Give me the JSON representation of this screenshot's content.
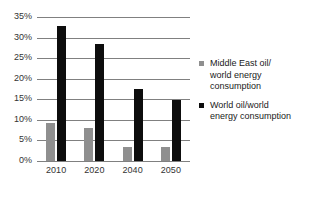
{
  "chart_data": {
    "type": "bar",
    "title": "",
    "subtitle": "",
    "xlabel": "",
    "ylabel": "",
    "categories": [
      "2010",
      "2020",
      "2040",
      "2050"
    ],
    "series": [
      {
        "name": "Middle East oil/world energy consumption",
        "color": "#8f8f8f",
        "values": [
          9.2,
          8.0,
          3.4,
          3.4
        ]
      },
      {
        "name": "World oil/world energy consumption",
        "color": "#0d0d0d",
        "values": [
          32.8,
          28.5,
          17.5,
          14.9
        ]
      }
    ],
    "ylim": [
      0,
      35
    ],
    "ytick_step": 5,
    "ytick_labels": [
      "0%",
      "5%",
      "10%",
      "15%",
      "20%",
      "25%",
      "30%",
      "35%"
    ],
    "ytick_values": [
      0,
      5,
      10,
      15,
      20,
      25,
      30,
      35
    ],
    "grid": true,
    "grid_axis": "y",
    "legend_position": "right",
    "legend": [
      {
        "marker": "gray-square-icon",
        "lines": [
          "Middle East oil/",
          "world energy",
          "consumption"
        ]
      },
      {
        "marker": "black-square-icon",
        "lines": [
          "World oil/world",
          "energy consumption"
        ]
      }
    ],
    "colors": {
      "series_0": "#8f8f8f",
      "series_1": "#0d0d0d",
      "gridline": "#808080",
      "axis_text": "#333333",
      "background": "#ffffff"
    }
  }
}
